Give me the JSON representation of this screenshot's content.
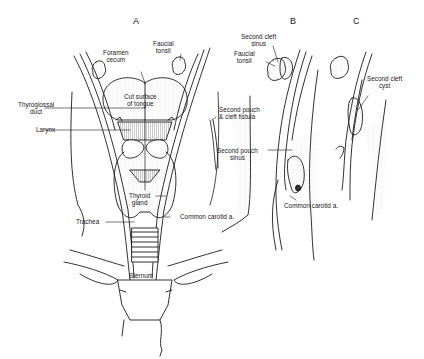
{
  "figure": {
    "panels": [
      {
        "id": "A",
        "label": "A"
      },
      {
        "id": "B",
        "label": "B"
      },
      {
        "id": "C",
        "label": "C"
      }
    ],
    "labels": {
      "foramen_cecum": "Foramen\ncecum",
      "faucial_tonsil_a": "Faucial\ntonsil",
      "cut_surface": "Cut surface\nof tongue",
      "thyroglossal_duct": "Thyroglossal\nduct",
      "larynx": "Larynx",
      "thyroid_gland": "Thyroid\ngland",
      "trachea": "Trachea",
      "common_carotid_a": "Common carotid a.",
      "sternum": "Sternum",
      "second_pouch_fistula": "Second pouch\n& cleft fistula",
      "second_cleft_sinus": "Second cleft\nsinus",
      "faucial_tonsil_b": "Faucial\ntonsil",
      "second_pouch_sinus": "Second pouch\nsinus",
      "common_carotid_b": "Common carotid a.",
      "second_cleft_cyst": "Second cleft\ncyst"
    },
    "colors": {
      "ink": "#1a1a1a",
      "stipple": "#9a9a9a",
      "background": "#ffffff"
    }
  }
}
